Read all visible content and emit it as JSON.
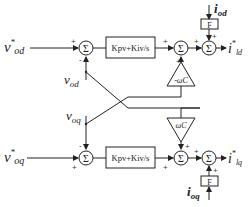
{
  "diagram": {
    "type": "control-block-diagram",
    "d_axis": {
      "reference_input": {
        "main": "v",
        "sup": "*",
        "sub": "od"
      },
      "feedback_input": {
        "main": "v",
        "sub": "od"
      },
      "pi_block": "Kpv+Kiv/s",
      "cross_gain": "-ωC",
      "feedforward_current": {
        "main": "i",
        "sub": "od"
      },
      "feedforward_gain": "F",
      "output": {
        "main": "i",
        "sup": "*",
        "sub": "ld"
      },
      "sum1_signs": [
        "+",
        "-"
      ],
      "sum2_signs": [
        "+",
        "+"
      ],
      "sum3_signs": [
        "+",
        "+"
      ]
    },
    "q_axis": {
      "reference_input": {
        "main": "v",
        "sup": "*",
        "sub": "oq"
      },
      "feedback_input": {
        "main": "v",
        "sub": "oq"
      },
      "pi_block": "Kpv+Kiv/s",
      "cross_gain": "ωC",
      "feedforward_current": {
        "main": "i",
        "sub": "oq"
      },
      "feedforward_gain": "F",
      "output": {
        "main": "i",
        "sup": "*",
        "sub": "lq"
      },
      "sum1_signs": [
        "+",
        "-"
      ],
      "sum2_signs": [
        "+",
        "+"
      ],
      "sum3_signs": [
        "+",
        "+"
      ]
    },
    "summing_symbol": "Σ"
  }
}
